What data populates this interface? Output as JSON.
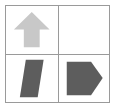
{
  "canvas": {
    "width": 116,
    "height": 109,
    "background_color": "#ffffff",
    "border_color": "#9a9a9a"
  },
  "grid": {
    "rows": 2,
    "columns": 2,
    "cells": [
      {
        "position": "top-left",
        "shape": "up-arrow",
        "fill_color": "#c8c8c8",
        "description": "light gray upward pointing arrow"
      },
      {
        "position": "top-right",
        "shape": "none",
        "fill_color": "#ffffff",
        "description": "empty white cell"
      },
      {
        "position": "bottom-left",
        "shape": "parallelogram",
        "fill_color": "#5d5d5d",
        "description": "dark gray slanted parallelogram"
      },
      {
        "position": "bottom-right",
        "shape": "pentagon-arrow",
        "fill_color": "#5d5d5d",
        "description": "dark gray pentagon with point at right"
      }
    ]
  }
}
